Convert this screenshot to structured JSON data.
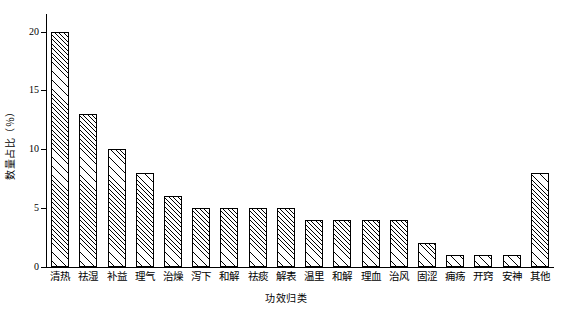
{
  "chart_data": {
    "type": "bar",
    "title": "",
    "subtitle": "",
    "xlabel": "功效归类",
    "ylabel": "数量占比（％）",
    "categories": [
      "清热",
      "祛湿",
      "补益",
      "理气",
      "治燥",
      "泻下",
      "和解",
      "祛痰",
      "解表",
      "温里",
      "和解",
      "理血",
      "治风",
      "固涩",
      "痈疡",
      "开窍",
      "安神",
      "其他"
    ],
    "values": [
      20,
      13,
      10,
      8,
      6,
      5,
      5,
      5,
      5,
      4,
      4,
      4,
      4,
      2,
      1,
      1,
      1,
      8
    ],
    "ylim": [
      0,
      21.5
    ],
    "yticks": [
      0,
      5,
      10,
      15,
      20
    ],
    "ytick_labels": [
      "0",
      "5",
      "10",
      "15",
      "20"
    ],
    "grid": false,
    "legend": null,
    "legend_position": "none",
    "bar_style": "hatched-diagonal",
    "colors": {
      "bar_fill": "#ffffff",
      "bar_edge": "#000000",
      "axis": "#000000",
      "text": "#000000",
      "background": "#ffffff"
    }
  }
}
